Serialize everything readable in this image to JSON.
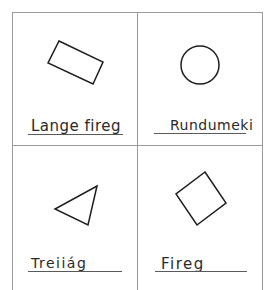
{
  "worksheet": {
    "cells": [
      {
        "shape": "rectangle",
        "label": "Lange fireg"
      },
      {
        "shape": "circle",
        "label": "Rundumeki"
      },
      {
        "shape": "triangle",
        "label": "Treiiág"
      },
      {
        "shape": "square",
        "label": "Fireg"
      }
    ]
  }
}
